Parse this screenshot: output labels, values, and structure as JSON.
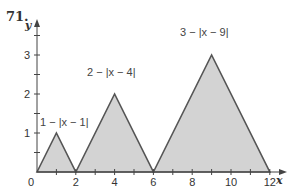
{
  "problem_number": "71.",
  "chart_data": {
    "type": "area",
    "title": "",
    "xlabel": "x",
    "ylabel": "y",
    "xlim": [
      0,
      12
    ],
    "ylim": [
      0,
      3.5
    ],
    "x_ticks": [
      0,
      2,
      4,
      6,
      8,
      10,
      12
    ],
    "x_tick_labels": [
      "0",
      "2",
      "4",
      "6",
      "8",
      "10",
      "12"
    ],
    "y_ticks": [
      1,
      2,
      3
    ],
    "y_tick_labels": [
      "1",
      "2",
      "3"
    ],
    "grid": false,
    "fill_color": "#d3d3d3",
    "line_color": "#555555",
    "series": [
      {
        "name": "1 − |x − 1|",
        "x": [
          0,
          1,
          2
        ],
        "values": [
          0,
          1,
          0
        ]
      },
      {
        "name": "2 − |x − 4|",
        "x": [
          2,
          4,
          6
        ],
        "values": [
          0,
          2,
          0
        ]
      },
      {
        "name": "3 − |x − 9|",
        "x": [
          6,
          9,
          12
        ],
        "values": [
          0,
          3,
          0
        ]
      }
    ],
    "annotations": [
      "1 − |x − 1|",
      "2 − |x − 4|",
      "3 − |x − 9|"
    ]
  }
}
